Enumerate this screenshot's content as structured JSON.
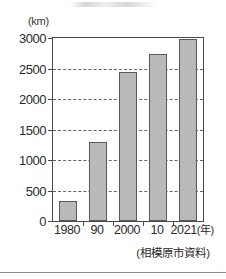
{
  "figure": {
    "unit_label": "(km)",
    "source_note": "(相模原市資料)",
    "x_axis_suffix": "(年)"
  },
  "chart_data": {
    "type": "bar",
    "title": "",
    "xlabel": "(年)",
    "ylabel": "(km)",
    "categories": [
      "1980",
      "90",
      "2000",
      "10",
      "2021"
    ],
    "values": [
      320,
      1300,
      2450,
      2730,
      2980
    ],
    "ylim": [
      0,
      3000
    ],
    "ytick_labels": [
      "0",
      "500",
      "1000",
      "1500",
      "2000",
      "2500",
      "3000"
    ],
    "ytick_values": [
      0,
      500,
      1000,
      1500,
      2000,
      2500,
      3000
    ],
    "grid": true,
    "legend": "none",
    "bar_color": "#b9b9b9",
    "bar_edge_color": "#595959",
    "annotation": "(相模原市資料)"
  }
}
